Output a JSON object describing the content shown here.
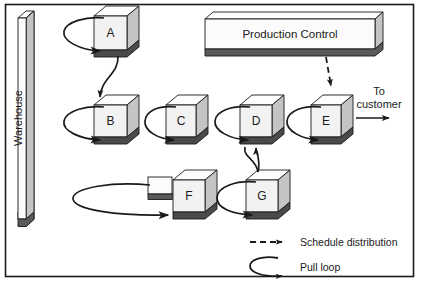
{
  "diagram": {
    "frame": {
      "stroke": "#1a1a1a"
    },
    "palette": {
      "box_face": "#f2f2f2",
      "box_top": "#fdfdfd",
      "box_side": "#c9c9c9",
      "box_shadow": "#4a4a4a",
      "bar_face": "#fbfbfb",
      "bar_side": "#c4c4c4",
      "bar_shadow": "#5a5a5a",
      "line": "#1a1a1a"
    },
    "warehouse": {
      "label": "Warehouse"
    },
    "production_control": {
      "label": "Production Control"
    },
    "nodes": [
      {
        "id": "A",
        "label": "A"
      },
      {
        "id": "B",
        "label": "B"
      },
      {
        "id": "C",
        "label": "C"
      },
      {
        "id": "D",
        "label": "D"
      },
      {
        "id": "E",
        "label": "E"
      },
      {
        "id": "F",
        "label": "F"
      },
      {
        "id": "G",
        "label": "G"
      }
    ],
    "annotations": {
      "to_customer_line1": "To",
      "to_customer_line2": "customer"
    },
    "legend": {
      "items": [
        {
          "key": "schedule",
          "label": "Schedule distribution",
          "style": "dashed-arrow"
        },
        {
          "key": "pull",
          "label": "Pull loop",
          "style": "curved-arrow"
        }
      ]
    }
  }
}
